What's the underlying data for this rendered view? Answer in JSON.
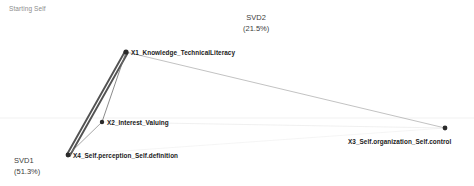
{
  "chart_title": "Starting Self",
  "axes": {
    "x_axis_label": "SVD1\n(51.3%)",
    "x_axis_name": "SVD1",
    "x_axis_variance": "(51.3%)",
    "y_axis_label": "SVD2\n(21.5%)",
    "y_axis_name": "SVD2",
    "y_axis_variance": "(21.5%)"
  },
  "chart_data": {
    "type": "scatter",
    "title": "Starting Self",
    "xlabel": "SVD1 (51.3%)",
    "ylabel": "SVD2 (21.5%)",
    "grid": true,
    "legend": "none",
    "nodes": [
      {
        "id": "X1",
        "label": "X1_Knowledge_TechnicalLiteracy",
        "x": 126,
        "y": 52,
        "marker_radius": 2.6,
        "color": "#2b2b2b",
        "label_dx": 5,
        "label_dy": -3.5
      },
      {
        "id": "X2",
        "label": "X2_Interest_Valuing",
        "x": 102,
        "y": 122,
        "marker_radius": 2.2,
        "color": "#2b2b2b",
        "label_dx": 5,
        "label_dy": -3.5
      },
      {
        "id": "X3",
        "label": "X3_Self.organization_Self.control",
        "x": 445,
        "y": 128,
        "marker_radius": 2.4,
        "color": "#2b2b2b",
        "label_dx": -97,
        "label_dy": 10
      },
      {
        "id": "X4",
        "label": "X4_Self.perception_Self.definition",
        "x": 68,
        "y": 155,
        "marker_radius": 2.4,
        "color": "#2b2b2b",
        "label_dx": 5,
        "label_dy": -3.5
      }
    ],
    "edges": [
      {
        "from": "X1",
        "to": "X4",
        "width": 1.9,
        "color": "#4a4a4a",
        "opacity": 0.95,
        "offset": -1.9
      },
      {
        "from": "X1",
        "to": "X4",
        "width": 1.9,
        "color": "#4a4a4a",
        "opacity": 0.95,
        "offset": 1.2
      },
      {
        "from": "X1",
        "to": "X2",
        "width": 0.9,
        "color": "#6e6e6e",
        "opacity": 0.9,
        "offset": 0
      },
      {
        "from": "X2",
        "to": "X4",
        "width": 0.8,
        "color": "#7a7a7a",
        "opacity": 0.85,
        "offset": 0
      },
      {
        "from": "X1",
        "to": "X3",
        "width": 0.55,
        "color": "#8a8a8a",
        "opacity": 0.95,
        "offset": 0
      },
      {
        "from": "X2",
        "to": "X3",
        "width": 0.4,
        "color": "#cfcfcf",
        "opacity": 0.8,
        "offset": 0
      },
      {
        "from": "X4",
        "to": "X3",
        "width": 0.4,
        "color": "#dcdcdc",
        "opacity": 0.7,
        "offset": 0
      }
    ],
    "gridlines": [
      {
        "orientation": "horizontal",
        "y": 118,
        "color": "#ebebeb",
        "width": 0.7
      }
    ]
  },
  "colors": {
    "background": "#ffffff",
    "node": "#2b2b2b",
    "edge_strong": "#4a4a4a",
    "edge_weak": "#cfcfcf",
    "title_text": "#8d8d8d",
    "axis_text": "#3c3c3c",
    "label_text": "#1a1a1a",
    "gridline": "#ebebeb"
  }
}
